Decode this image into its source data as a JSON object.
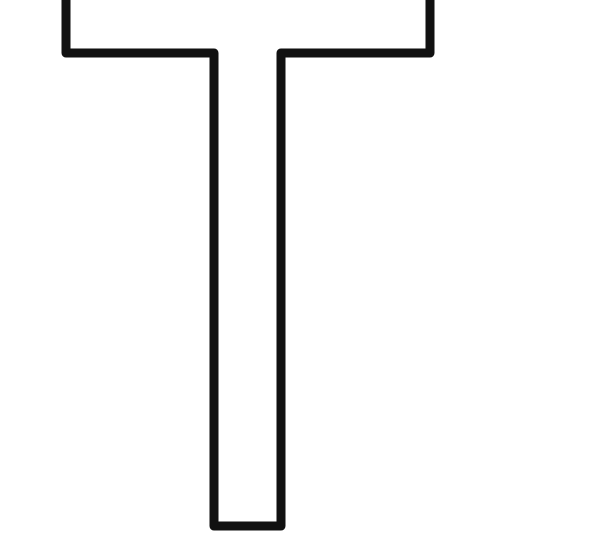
{
  "figure": {
    "shape": "T-outline",
    "stroke_color": "#111111",
    "fill_color": "#ffffff",
    "background": "#ffffff",
    "stroke_width": 9
  }
}
